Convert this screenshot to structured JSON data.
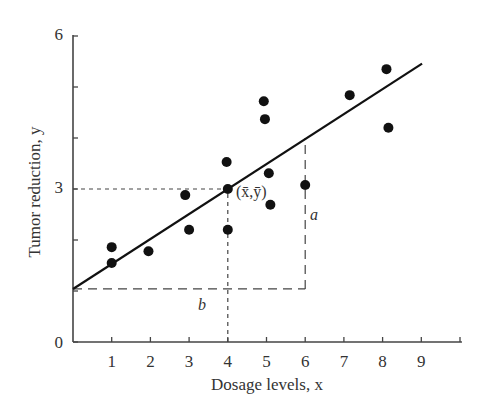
{
  "chart_data": {
    "type": "scatter",
    "title": "",
    "xlabel": "Dosage levels, x",
    "ylabel": "Tumor reduction, y",
    "xlim": [
      0,
      10
    ],
    "ylim": [
      0,
      6
    ],
    "x_ticks": [
      1,
      2,
      3,
      4,
      5,
      6,
      7,
      8,
      9
    ],
    "x_tick_labels": [
      "1",
      "2",
      "3",
      "4",
      "5",
      "6",
      "7",
      "8",
      "9"
    ],
    "y_ticks": [
      0,
      1,
      2,
      3,
      4,
      5,
      6
    ],
    "y_tick_labels": [
      "0",
      "",
      "",
      "3",
      "",
      "",
      "6"
    ],
    "grid": false,
    "legend": null,
    "series": [
      {
        "name": "observations",
        "type": "scatter",
        "points": [
          {
            "x": 1.0,
            "y": 1.86
          },
          {
            "x": 1.0,
            "y": 1.55
          },
          {
            "x": 1.95,
            "y": 1.78
          },
          {
            "x": 2.9,
            "y": 2.88
          },
          {
            "x": 3.0,
            "y": 2.2
          },
          {
            "x": 4.0,
            "y": 2.2
          },
          {
            "x": 3.97,
            "y": 3.53
          },
          {
            "x": 4.0,
            "y": 3.0
          },
          {
            "x": 4.93,
            "y": 4.72
          },
          {
            "x": 4.96,
            "y": 4.37
          },
          {
            "x": 5.06,
            "y": 3.31
          },
          {
            "x": 5.1,
            "y": 2.69
          },
          {
            "x": 6.0,
            "y": 3.08
          },
          {
            "x": 7.15,
            "y": 4.84
          },
          {
            "x": 8.1,
            "y": 5.35
          },
          {
            "x": 8.15,
            "y": 4.2
          }
        ]
      },
      {
        "name": "regression line",
        "type": "line",
        "intercept": 1.04,
        "slope": 0.49,
        "x_range": [
          0,
          9.02
        ]
      }
    ],
    "annotations": [
      {
        "text": "(x̄,ȳ)",
        "x": 4.0,
        "y": 3.0,
        "note": "mean point"
      },
      {
        "text": "a",
        "x": 6.0,
        "y": 2.5,
        "note": "rise of line from x=0 baseline at x=6"
      },
      {
        "text": "b",
        "x": 3.4,
        "y": 0.65,
        "note": "run from y-axis"
      }
    ],
    "reference_lines": [
      {
        "type": "dashed-horizontal",
        "y": 3.0,
        "x_from": 0,
        "x_to": 4.0
      },
      {
        "type": "dashed-vertical",
        "x": 4.0,
        "y_from": 0,
        "y_to": 3.0
      },
      {
        "type": "dashed-horizontal",
        "y": 1.04,
        "x_from": 0,
        "x_to": 6.0
      },
      {
        "type": "dashed-vertical",
        "x": 6.0,
        "y_from": 1.04,
        "y_to": 4.0
      }
    ]
  },
  "labels": {
    "xlabel": "Dosage levels, x",
    "ylabel": "Tumor reduction, y",
    "mean_point": "(x̄,ȳ)",
    "a": "a",
    "b": "b",
    "y0": "0",
    "y3": "3",
    "y6": "6"
  }
}
